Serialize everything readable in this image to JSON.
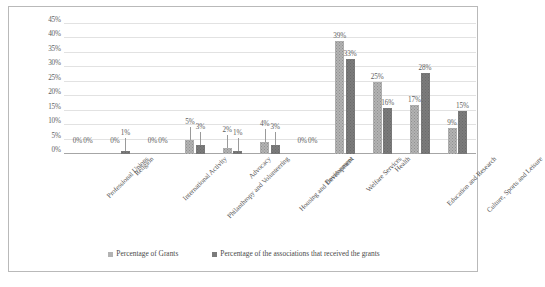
{
  "chart_data": {
    "type": "bar",
    "title": "",
    "subtitle": "",
    "xlabel": "",
    "ylabel": "",
    "ylim": [
      0,
      45
    ],
    "ytick_step": 5,
    "grid": true,
    "legend_position": "bottom-center",
    "orientation": "vertical",
    "grouping": "clustered",
    "categories": [
      "Professional Unions",
      "Religion",
      "International Activity",
      "Philanthropy and Volunteering",
      "Advocacy",
      "Housing and Development",
      "Environment",
      "Welfare Services",
      "Health",
      "Education and Research",
      "Culture, Sports and Leisure"
    ],
    "ytick_labels": [
      "0%",
      "5%",
      "10%",
      "15%",
      "20%",
      "25%",
      "30%",
      "35%",
      "40%",
      "45%"
    ],
    "ytick_values": [
      0,
      5,
      10,
      15,
      20,
      25,
      30,
      35,
      40,
      45
    ],
    "series": [
      {
        "name": "Percentage of Grants",
        "color": "#b3b3b3",
        "values": [
          0,
          0,
          0,
          5,
          2,
          4,
          0,
          39,
          25,
          17,
          9
        ],
        "labels": [
          "0%",
          "0%",
          "0%",
          "5%",
          "2%",
          "4%",
          "0%",
          "39%",
          "25%",
          "17%",
          "9%"
        ]
      },
      {
        "name": "Percentage of the associations that received the grants",
        "color": "#7b7b7b",
        "values": [
          0,
          1,
          0,
          3,
          1,
          3,
          0,
          33,
          16,
          28,
          15
        ],
        "labels": [
          "0%",
          "1%",
          "0%",
          "3%",
          "1%",
          "3%",
          "0%",
          "33%",
          "16%",
          "28%",
          "15%"
        ]
      }
    ]
  },
  "legend": {
    "items": [
      {
        "label": "Percentage of Grants",
        "marker": "square-marker"
      },
      {
        "label": "Percentage of the associations that received the grants",
        "marker": "square-marker"
      }
    ]
  },
  "caption": {
    "text": ""
  }
}
